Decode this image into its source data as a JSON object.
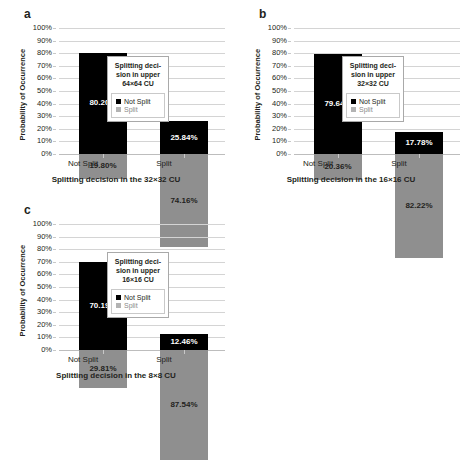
{
  "chart_data": [
    {
      "type": "bar",
      "panel": "a",
      "title": "",
      "xlabel": "Splitting decision in the 32×32 CU",
      "ylabel": "Probability of Occurrence",
      "ylim": [
        0,
        100
      ],
      "ytick_labels": [
        "100%",
        "90%",
        "80%",
        "70%",
        "60%",
        "50%",
        "40%",
        "30%",
        "20%",
        "10%",
        "0%"
      ],
      "grid": true,
      "stacked": true,
      "categories": [
        "Not Split",
        "Split"
      ],
      "series": [
        {
          "name": "Not Split",
          "color": "#000000",
          "values": [
            80.2,
            25.84
          ],
          "labels": [
            "80.20%",
            "25.84%"
          ]
        },
        {
          "name": "Split",
          "color": "#8f8f8f",
          "values": [
            19.8,
            74.16
          ],
          "labels": [
            "19.80%",
            "74.16%"
          ]
        }
      ],
      "legend": {
        "position": "center",
        "title": "Splitting deci-\nsion in upper\n64×64 CU",
        "title_line1": "Splitting deci-",
        "title_line2": "sion in upper",
        "title_line3": "64×64 CU",
        "entries": [
          {
            "label": "Not Split",
            "color": "#000000"
          },
          {
            "label": "Split",
            "color": "#b3b3b3"
          }
        ]
      }
    },
    {
      "type": "bar",
      "panel": "b",
      "title": "",
      "xlabel": "Splitting decision in the 16×16 CU",
      "ylabel": "Probability of Occurrence",
      "ylim": [
        0,
        100
      ],
      "ytick_labels": [
        "100%",
        "90%",
        "80%",
        "70%",
        "60%",
        "50%",
        "40%",
        "30%",
        "20%",
        "10%",
        "0%"
      ],
      "grid": true,
      "stacked": true,
      "categories": [
        "Not Split",
        "Split"
      ],
      "series": [
        {
          "name": "Not Split",
          "color": "#000000",
          "values": [
            79.64,
            17.78
          ],
          "labels": [
            "79.64%",
            "17.78%"
          ]
        },
        {
          "name": "Split",
          "color": "#8f8f8f",
          "values": [
            20.36,
            82.22
          ],
          "labels": [
            "20.36%",
            "82.22%"
          ]
        }
      ],
      "legend": {
        "position": "center",
        "title": "Splitting deci-\nsion in upper\n32×32 CU",
        "title_line1": "Splitting deci-",
        "title_line2": "sion in upper",
        "title_line3": "32×32 CU",
        "entries": [
          {
            "label": "Not Split",
            "color": "#000000"
          },
          {
            "label": "Split",
            "color": "#b3b3b3"
          }
        ]
      }
    },
    {
      "type": "bar",
      "panel": "c",
      "title": "",
      "xlabel": "Splitting decision in the 8×8 CU",
      "ylabel": "Probability of Occurrence",
      "ylim": [
        0,
        100
      ],
      "ytick_labels": [
        "100%",
        "90%",
        "80%",
        "70%",
        "60%",
        "50%",
        "40%",
        "30%",
        "20%",
        "10%",
        "0%"
      ],
      "grid": true,
      "stacked": true,
      "categories": [
        "Not Split",
        "Split"
      ],
      "series": [
        {
          "name": "Not Split",
          "color": "#000000",
          "values": [
            70.19,
            12.46
          ],
          "labels": [
            "70.19%",
            "12.46%"
          ]
        },
        {
          "name": "Split",
          "color": "#8f8f8f",
          "values": [
            29.81,
            87.54
          ],
          "labels": [
            "29.81%",
            "87.54%"
          ]
        }
      ],
      "legend": {
        "position": "center",
        "title": "Splitting deci-\nsion in upper\n16×16 CU",
        "title_line1": "Splitting deci-",
        "title_line2": "sion in upper",
        "title_line3": "16×16 CU",
        "entries": [
          {
            "label": "Not Split",
            "color": "#000000"
          },
          {
            "label": "Split",
            "color": "#b3b3b3"
          }
        ]
      }
    }
  ],
  "panels": [
    {
      "letter": "a"
    },
    {
      "letter": "b"
    },
    {
      "letter": "c"
    }
  ]
}
